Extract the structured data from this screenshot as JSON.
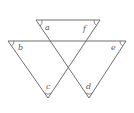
{
  "diagram": {
    "type": "geometry-angles",
    "labels": {
      "a": "a",
      "b": "b",
      "c": "c",
      "d": "d",
      "e": "e",
      "f": "f"
    },
    "colors": {
      "line": "#6e6e6e",
      "text": "#555555",
      "background": "#ffffff"
    }
  }
}
